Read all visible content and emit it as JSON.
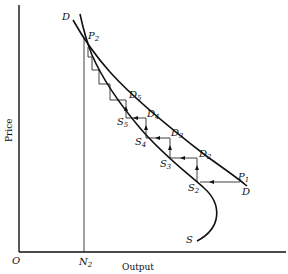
{
  "diagram": {
    "type": "cobweb-supply-demand",
    "axes": {
      "origin_label": "O",
      "x_label": "Output",
      "y_label": "Price",
      "x_tick_label": "N",
      "x_tick_sub": "2"
    },
    "curves": {
      "demand": {
        "label": "D",
        "label_end": "D"
      },
      "supply": {
        "label": "S"
      }
    },
    "points": {
      "P2": {
        "main": "P",
        "sub": "2"
      },
      "P1": {
        "main": "P",
        "sub": "1"
      },
      "D2": {
        "main": "D",
        "sub": "2"
      },
      "D3": {
        "main": "D",
        "sub": "3"
      },
      "D4": {
        "main": "D",
        "sub": "4"
      },
      "D5": {
        "main": "D",
        "sub": "5"
      },
      "S2": {
        "main": "S",
        "sub": "2"
      },
      "S3": {
        "main": "S",
        "sub": "3"
      },
      "S4": {
        "main": "S",
        "sub": "4"
      },
      "S5": {
        "main": "S",
        "sub": "5"
      }
    },
    "colors": {
      "ink": "#111111",
      "background": "#ffffff"
    }
  }
}
